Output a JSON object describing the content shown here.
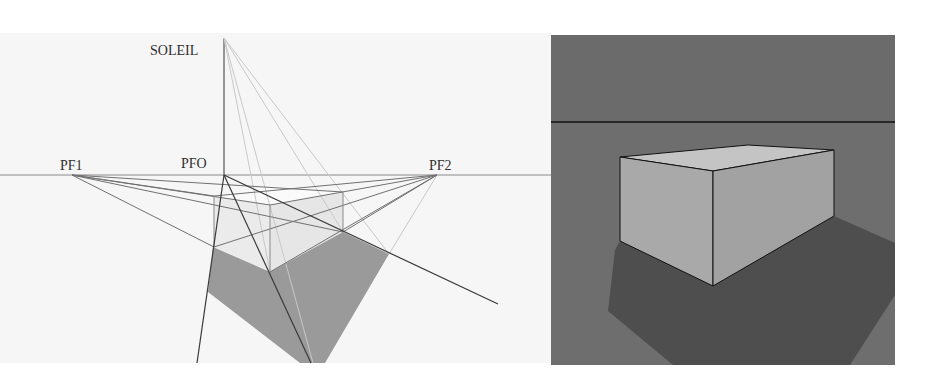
{
  "left_diagram": {
    "labels": {
      "sun": "SOLEIL",
      "vanishing_point_left": "PF1",
      "vanishing_point_origin": "PFO",
      "vanishing_point_right": "PF2"
    },
    "colors": {
      "background": "#f6f6f6",
      "box_face": "#ebebeb",
      "shadow": "#9a9a9a",
      "construction_line": "#6a6a6a",
      "light_ray": "#c8c8c8",
      "label": "#2e2e2e"
    }
  },
  "right_render": {
    "colors": {
      "sky": "#6b6b6b",
      "ground": "#6e6e6e",
      "horizon_line": "#111111",
      "box_top": "#c4c4c4",
      "box_left_face": "#a9a9a9",
      "box_right_face": "#a2a2a2",
      "shadow": "#4e4e4e",
      "edge": "#111111"
    }
  }
}
